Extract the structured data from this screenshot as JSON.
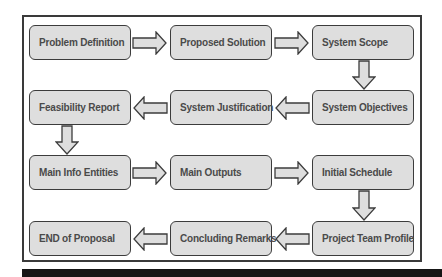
{
  "diagram": {
    "type": "process-flow",
    "layout": "serpentine-grid-3-columns-4-rows",
    "colors": {
      "node_fill": "#dedede",
      "node_border": "#3c3c3c",
      "arrow_fill": "#dedede",
      "arrow_border": "#3c3c3c",
      "text": "#4a4a4a",
      "frame_border": "#3a3a3a",
      "bottom_bar": "#161616"
    },
    "nodes": [
      {
        "id": "n1",
        "label": "Problem Definition",
        "row": 1,
        "col": 1
      },
      {
        "id": "n2",
        "label": "Proposed Solution",
        "row": 1,
        "col": 2
      },
      {
        "id": "n3",
        "label": "System Scope",
        "row": 1,
        "col": 3
      },
      {
        "id": "n4",
        "label": "System Objectives",
        "row": 2,
        "col": 3
      },
      {
        "id": "n5",
        "label": "System Justification",
        "row": 2,
        "col": 2
      },
      {
        "id": "n6",
        "label": "Feasibility Report",
        "row": 2,
        "col": 1
      },
      {
        "id": "n7",
        "label": "Main Info Entities",
        "row": 3,
        "col": 1
      },
      {
        "id": "n8",
        "label": "Main Outputs",
        "row": 3,
        "col": 2
      },
      {
        "id": "n9",
        "label": "Initial Schedule",
        "row": 3,
        "col": 3
      },
      {
        "id": "n10",
        "label": "Project Team Profile",
        "row": 4,
        "col": 3
      },
      {
        "id": "n11",
        "label": "Concluding Remarks",
        "row": 4,
        "col": 2
      },
      {
        "id": "n12",
        "label": "END of Proposal",
        "row": 4,
        "col": 1
      }
    ],
    "edges": [
      {
        "from": "n1",
        "to": "n2",
        "direction": "right"
      },
      {
        "from": "n2",
        "to": "n3",
        "direction": "right"
      },
      {
        "from": "n3",
        "to": "n4",
        "direction": "down"
      },
      {
        "from": "n4",
        "to": "n5",
        "direction": "left"
      },
      {
        "from": "n5",
        "to": "n6",
        "direction": "left"
      },
      {
        "from": "n6",
        "to": "n7",
        "direction": "down"
      },
      {
        "from": "n7",
        "to": "n8",
        "direction": "right"
      },
      {
        "from": "n8",
        "to": "n9",
        "direction": "right"
      },
      {
        "from": "n9",
        "to": "n10",
        "direction": "down"
      },
      {
        "from": "n10",
        "to": "n11",
        "direction": "left"
      },
      {
        "from": "n11",
        "to": "n12",
        "direction": "left"
      }
    ]
  }
}
